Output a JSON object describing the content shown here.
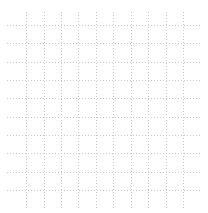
{
  "page": {
    "background_color": "#ffffff"
  },
  "grid": {
    "line_color": "#c9c9c9",
    "dot_px": 1,
    "gap_px": 2,
    "vertical_lines": {
      "x_positions": [
        26,
        44,
        61,
        78,
        96,
        113,
        131,
        148,
        166,
        183
      ],
      "y_start": 12,
      "y_end": 208
    },
    "horizontal_lines": {
      "y_positions": [
        25,
        43,
        62,
        80,
        98,
        117,
        135,
        153,
        172,
        190
      ],
      "x_start": 7,
      "x_end": 201
    }
  }
}
